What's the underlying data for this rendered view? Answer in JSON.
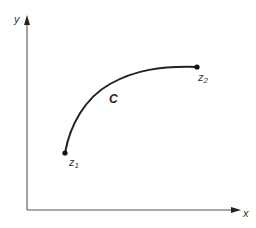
{
  "diagram": {
    "type": "curve-in-plane",
    "axes": {
      "x_label": "x",
      "y_label": "y"
    },
    "curve": {
      "label": "C",
      "start": {
        "name": "z",
        "subscript": "1"
      },
      "end": {
        "name": "z",
        "subscript": "2"
      }
    },
    "colors": {
      "axis": "#555555",
      "curve": "#222222",
      "text": "#333333"
    }
  }
}
